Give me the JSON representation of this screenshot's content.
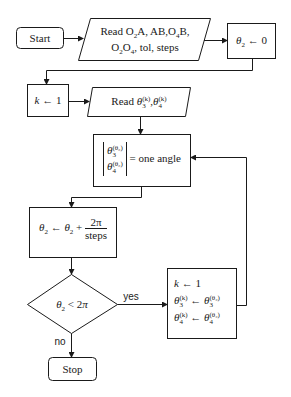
{
  "diagram": {
    "type": "flowchart",
    "nodes": {
      "start": {
        "shape": "terminal",
        "label": "Start"
      },
      "read_inputs": {
        "shape": "input",
        "line1": "Read O₂A, AB,O₄B,",
        "line2": "O₂O₄, tol, steps"
      },
      "init_theta2": {
        "shape": "process",
        "label": "θ₂ ← 0"
      },
      "init_k": {
        "shape": "process",
        "label": "k ← 1"
      },
      "read_guess": {
        "shape": "input",
        "prefix": "Read",
        "label": "Read θ₃⁽ᵏ⁾, θ₄⁽ᵏ⁾"
      },
      "solve": {
        "shape": "process",
        "rhs": "= one angle",
        "label": "[θ₃^(θ₂); θ₄^(θ₂)] = one angle"
      },
      "increment": {
        "shape": "process",
        "lhs": "θ₂ ← θ₂ +",
        "numerator": "2π",
        "denominator": "steps"
      },
      "decision": {
        "shape": "decision",
        "label": "θ₂ < 2π"
      },
      "update": {
        "shape": "process",
        "line1": "k ← 1",
        "line2": "θ₃⁽ᵏ⁾ ← θ₃^(θ₂)",
        "line3": "θ₄⁽ᵏ⁾ ← θ₄^(θ₂)"
      },
      "stop": {
        "shape": "terminal",
        "label": "Stop"
      }
    },
    "edge_labels": {
      "yes": "yes",
      "no": "no"
    },
    "edges": [
      {
        "from": "start",
        "to": "read_inputs"
      },
      {
        "from": "read_inputs",
        "to": "init_theta2"
      },
      {
        "from": "init_theta2",
        "to": "init_k"
      },
      {
        "from": "init_k",
        "to": "read_guess"
      },
      {
        "from": "read_guess",
        "to": "solve"
      },
      {
        "from": "solve",
        "to": "increment"
      },
      {
        "from": "increment",
        "to": "decision"
      },
      {
        "from": "decision",
        "to": "update",
        "label": "yes"
      },
      {
        "from": "decision",
        "to": "stop",
        "label": "no"
      },
      {
        "from": "update",
        "to": "solve"
      }
    ],
    "colors": {
      "stroke": "#1a1a1a",
      "background": "#ffffff"
    }
  }
}
